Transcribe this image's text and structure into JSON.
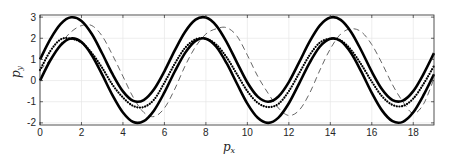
{
  "chart_data": {
    "type": "line",
    "title": "",
    "xlabel": "p_x",
    "ylabel": "p_y",
    "xlim": [
      0,
      19
    ],
    "ylim": [
      -2.1,
      3.1
    ],
    "grid": true,
    "legend": null,
    "xticks": [
      0,
      2,
      4,
      6,
      8,
      10,
      12,
      14,
      16,
      18
    ],
    "yticks": [
      -2,
      -1,
      0,
      1,
      2,
      3
    ],
    "x": [
      0,
      0.5,
      1,
      1.5,
      2,
      2.5,
      3,
      3.5,
      4,
      4.5,
      5,
      5.5,
      6,
      6.5,
      7,
      7.5,
      8,
      8.5,
      9,
      9.5,
      10,
      10.5,
      11,
      11.5,
      12,
      12.5,
      13,
      13.5,
      14,
      14.5,
      15,
      15.5,
      16,
      16.5,
      17,
      17.5,
      18,
      18.5,
      19
    ],
    "series": [
      {
        "name": "upper-bound",
        "style": "solid-thick",
        "values": [
          1.0,
          1.96,
          2.68,
          2.99,
          2.82,
          2.2,
          1.28,
          0.3,
          -0.51,
          -0.96,
          -0.92,
          -0.41,
          0.44,
          1.43,
          2.31,
          2.88,
          2.98,
          2.6,
          1.82,
          0.85,
          -0.09,
          -0.76,
          -1.0,
          -0.75,
          -0.07,
          0.87,
          1.84,
          2.61,
          2.98,
          2.87,
          2.3,
          1.41,
          0.42,
          -0.42,
          -0.92,
          -0.95,
          -0.5,
          0.32,
          1.3
        ]
      },
      {
        "name": "lower-bound",
        "style": "solid-thick",
        "values": [
          0.0,
          0.96,
          1.68,
          1.99,
          1.82,
          1.2,
          0.28,
          -0.7,
          -1.51,
          -1.96,
          -1.92,
          -1.41,
          -0.56,
          0.43,
          1.31,
          1.88,
          1.98,
          1.6,
          0.82,
          -0.15,
          -1.09,
          -1.76,
          -2.0,
          -1.75,
          -1.07,
          -0.13,
          0.84,
          1.61,
          1.98,
          1.87,
          1.3,
          0.41,
          -0.58,
          -1.42,
          -1.92,
          -1.95,
          -1.5,
          -0.68,
          0.3
        ]
      },
      {
        "name": "mid-dotted",
        "style": "dotted",
        "values": [
          0.5,
          1.4,
          1.95,
          1.98,
          1.8,
          1.3,
          0.6,
          -0.2,
          -0.8,
          -1.2,
          -1.25,
          -0.9,
          -0.1,
          0.8,
          1.55,
          1.95,
          1.98,
          1.7,
          1.1,
          0.3,
          -0.5,
          -1.05,
          -1.25,
          -1.1,
          -0.5,
          0.35,
          1.2,
          1.8,
          1.98,
          1.9,
          1.45,
          0.75,
          -0.05,
          -0.75,
          -1.15,
          -1.2,
          -0.85,
          -0.15,
          0.7
        ]
      },
      {
        "name": "dashed-lag",
        "style": "dashed-thin",
        "values": [
          0.5,
          1.0,
          1.75,
          2.3,
          2.6,
          2.6,
          2.1,
          1.2,
          0.2,
          -0.8,
          -1.5,
          -1.7,
          -1.3,
          -0.4,
          0.7,
          1.6,
          2.2,
          2.45,
          2.5,
          2.1,
          1.2,
          0.2,
          -0.6,
          -1.3,
          -1.65,
          -1.4,
          -0.6,
          0.5,
          1.5,
          2.2,
          2.45,
          2.3,
          1.7,
          0.8,
          -0.2,
          -1.0,
          -1.55,
          -1.1,
          0.1
        ]
      }
    ]
  },
  "axes": {
    "xlabel_main": "p",
    "xlabel_sub": "x",
    "ylabel_main": "p",
    "ylabel_sub": "y"
  }
}
